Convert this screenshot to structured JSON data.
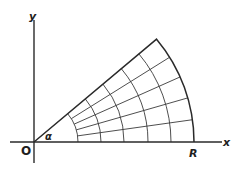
{
  "figure": {
    "labels": {
      "y_axis": "y",
      "x_axis": "x",
      "origin": "O",
      "radius": "R",
      "angle": "α"
    },
    "geometry": {
      "origin_px": [
        34,
        142
      ],
      "radius_px": 160,
      "angle_deg": 40,
      "radial_divisions": 5,
      "arc_radii_px": [
        44,
        67,
        90,
        114,
        137,
        160
      ],
      "x_axis_px": [
        10,
        222
      ],
      "y_axis_px": [
        20,
        163
      ]
    },
    "colors": {
      "line": "#2a2a2a",
      "background": "#ffffff"
    }
  }
}
